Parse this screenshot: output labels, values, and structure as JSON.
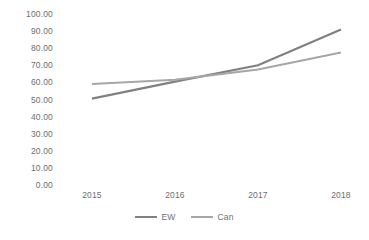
{
  "chart_data": {
    "type": "line",
    "title": "",
    "subtitle": "",
    "xlabel": "",
    "ylabel": "",
    "categories": [
      "2015",
      "2016",
      "2017",
      "2018"
    ],
    "series": [
      {
        "name": "EW",
        "color": "#808080",
        "line_width": 2.2,
        "values": [
          50.5,
          60.5,
          70.0,
          91.0
        ]
      },
      {
        "name": "Can",
        "color": "#A6A6A6",
        "line_width": 2.0,
        "values": [
          59.0,
          61.5,
          67.5,
          77.5
        ]
      }
    ],
    "ylim": [
      0,
      100
    ],
    "ytick_step": 10,
    "ytick_labels": [
      "100.00",
      "90.00",
      "80.00",
      "70.00",
      "60.00",
      "50.00",
      "40.00",
      "30.00",
      "20.00",
      "10.00",
      "0.00"
    ],
    "ytick_values": [
      100,
      90,
      80,
      70,
      60,
      50,
      40,
      30,
      20,
      10,
      0
    ],
    "grid": false,
    "axis_lines": false,
    "legend_position": "bottom-center",
    "legend_entries": [
      "EW",
      "Can"
    ],
    "annotations": [],
    "text_color": "#6e6e6e",
    "background_color": "#ffffff"
  },
  "layout": {
    "plot_left": 92,
    "plot_right": 341,
    "plot_top": 14,
    "plot_bottom": 185
  }
}
